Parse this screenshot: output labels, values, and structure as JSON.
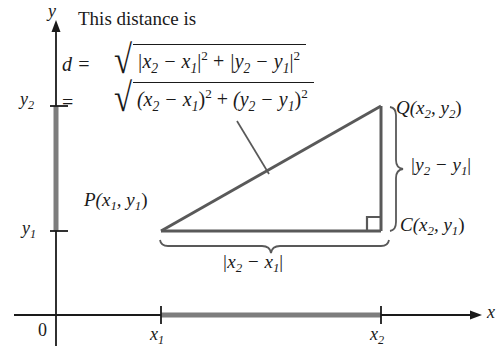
{
  "figure": {
    "caption": "This distance is",
    "background_color": "#ffffff",
    "ink_color": "#1a1a1a",
    "shape_color": "#595959"
  },
  "axes": {
    "y_label": "y",
    "x_label": "x",
    "origin_label": "0",
    "y_ticks": [
      {
        "id": "y1",
        "base": "y",
        "sub": "1"
      },
      {
        "id": "y2",
        "base": "y",
        "sub": "2"
      }
    ],
    "x_ticks": [
      {
        "id": "x1",
        "base": "x",
        "sub": "1"
      },
      {
        "id": "x2",
        "base": "x",
        "sub": "2"
      }
    ]
  },
  "formula": {
    "line1": {
      "lead": "d =",
      "radical_sign": "√",
      "radicand": {
        "term1_open": "|x",
        "term1_sub1": "2",
        "term1_minus": " − x",
        "term1_sub2": "1",
        "term1_close": "|",
        "term1_sup": "2",
        "plus": " + ",
        "term2_open": "|y",
        "term2_sub1": "2",
        "term2_minus": " − y",
        "term2_sub2": "1",
        "term2_close": "|",
        "term2_sup": "2",
        "plain": "|x₂ − x₁|² + |y₂ − y₁|²"
      }
    },
    "line2": {
      "lead": "=",
      "radical_sign": "√",
      "radicand": {
        "term1_open": "(x",
        "term1_sub1": "2",
        "term1_minus": " − x",
        "term1_sub2": "1",
        "term1_close": ")",
        "term1_sup": "2",
        "plus": " + ",
        "term2_open": "(y",
        "term2_sub1": "2",
        "term2_minus": " − y",
        "term2_sub2": "1",
        "term2_close": ")",
        "term2_sup": "2",
        "plain": "(x₂ − x₁)² + (y₂ − y₁)²"
      }
    }
  },
  "points": {
    "P": {
      "name": "P",
      "open": "(x",
      "sub1": "1",
      "comma": ", y",
      "sub2": "1",
      "close": ")"
    },
    "Q": {
      "name": "Q",
      "open": "(x",
      "sub1": "2",
      "comma": ", y",
      "sub2": "2",
      "close": ")"
    },
    "C": {
      "name": "C",
      "open": "(x",
      "sub1": "2",
      "comma": ", y",
      "sub2": "1",
      "close": ")"
    }
  },
  "braces": {
    "vertical": {
      "open": "|y",
      "sub1": "2",
      "minus": " − y",
      "sub2": "1",
      "close": "|"
    },
    "horizontal": {
      "open": "|x",
      "sub1": "2",
      "minus": " − x",
      "sub2": "1",
      "close": "|"
    }
  },
  "geometry": {
    "P_x": 161,
    "P_y": 231,
    "C_x": 381,
    "C_y": 231,
    "Q_x": 381,
    "Q_y": 106,
    "x_axis_y": 315,
    "y_axis_x": 56
  }
}
